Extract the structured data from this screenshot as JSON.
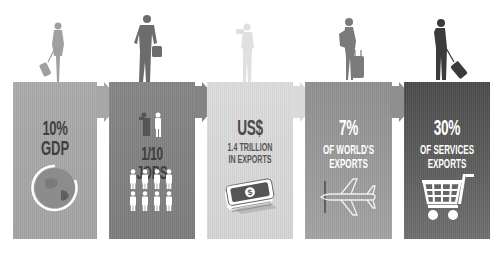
{
  "infographic": {
    "panels": [
      {
        "headline": "10%",
        "subline": "GDP",
        "icon": "globe-icon",
        "color": "#a7a7a7"
      },
      {
        "headline": "1/10 JOBS",
        "icon": "people-icon",
        "color": "#818181"
      },
      {
        "headline": "US$",
        "subline": "1.4 TRILLION",
        "subline2": "IN EXPORTS",
        "icon": "money-stack-icon",
        "color": "#d9d9d9"
      },
      {
        "headline": "7%",
        "subline": "OF WORLD'S",
        "subline2": "EXPORTS",
        "icon": "airplane-icon",
        "color": "#979797"
      },
      {
        "headline": "30%",
        "subline": "OF SERVICES",
        "subline2": "EXPORTS",
        "icon": "shopping-cart-icon",
        "color": "#5a5a5a"
      }
    ],
    "travelers": [
      {
        "icon": "woman-traveler-with-suitcase-icon",
        "color": "#9e9e9e"
      },
      {
        "icon": "man-traveler-with-bag-icon",
        "color": "#6e6e6e"
      },
      {
        "icon": "tourist-with-camera-icon",
        "color": "#e2e2e2"
      },
      {
        "icon": "woman-traveler-with-rolling-bag-icon",
        "color": "#7a7a7a"
      },
      {
        "icon": "man-traveler-with-rolling-bag-icon",
        "color": "#3c3c3c"
      }
    ]
  }
}
